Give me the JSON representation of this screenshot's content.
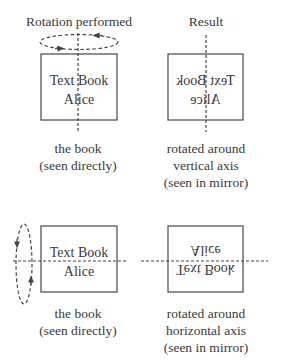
{
  "headers": {
    "left": "Rotation performed",
    "right": "Result"
  },
  "book": {
    "title": "Text Book",
    "author": "Alice"
  },
  "rows": [
    {
      "rotation_axis": "vertical",
      "left_caption": [
        "the book",
        "(seen directly)"
      ],
      "right_caption": [
        "rotated around",
        "vertical axis",
        "(seen in mirror)"
      ]
    },
    {
      "rotation_axis": "horizontal",
      "left_caption": [
        "the book",
        "(seen directly)"
      ],
      "right_caption": [
        "rotated around",
        "horizontal axis",
        "(seen in mirror)"
      ]
    }
  ],
  "colors": {
    "stroke": "#555555",
    "text": "#3a3a3a",
    "background": "#ffffff"
  }
}
